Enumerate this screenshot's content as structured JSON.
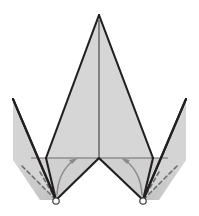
{
  "figure": {
    "canvas": {
      "width": 199,
      "height": 216,
      "background": "#ffffff"
    },
    "colors": {
      "face_light": "#d6d6d6",
      "face_mid": "#cfcfcf",
      "face_shadow_dark": "#8f8f8f",
      "face_shadow_light": "#cccccc",
      "outline": "#231f20",
      "thin_line": "#58595b",
      "dashed_line": "#6d6e71",
      "arrow": "#7a7a7a",
      "marker_fill": "#ffffff",
      "marker_stroke": "#3a3a3a"
    },
    "vertices": {
      "apex": {
        "label": "apex",
        "x": 99,
        "y": 15
      },
      "left_wing_tip": {
        "label": "left-wing-tip",
        "x": 13,
        "y": 99
      },
      "right_wing_tip": {
        "label": "right-wing-tip",
        "x": 186,
        "y": 99
      },
      "left_bottom_node": {
        "label": "left-bottom-node",
        "x": 56,
        "y": 200
      },
      "right_bottom_node": {
        "label": "right-bottom-node",
        "x": 143,
        "y": 200
      },
      "center_notch": {
        "label": "center-notch",
        "x": 99,
        "y": 158
      },
      "left_ridge_base": {
        "label": "left-ridge-base",
        "x": 38,
        "y": 158
      },
      "right_ridge_base": {
        "label": "right-ridge-base",
        "x": 161,
        "y": 158
      },
      "left_inner_fold": {
        "label": "left-inner-fold",
        "x": 46,
        "y": 158
      },
      "right_inner_fold": {
        "label": "right-inner-fold",
        "x": 153,
        "y": 158
      }
    },
    "faces": [
      {
        "name": "center-left-face",
        "fill": "face_light",
        "points": "99,15 99,158 46,158"
      },
      {
        "name": "center-right-face",
        "fill": "face_light",
        "points": "99,15 99,158 153,158"
      },
      {
        "name": "left-outer-face",
        "fill": "face_mid",
        "points": "13,99 38,158 56,200"
      },
      {
        "name": "right-outer-face",
        "fill": "face_mid",
        "points": "186,99 161,158 143,200"
      },
      {
        "name": "left-lower-panel",
        "fill": "face_light",
        "points": "38,158 99,158 99,163 56,200"
      },
      {
        "name": "right-lower-panel",
        "fill": "face_light",
        "points": "161,158 99,158 99,163 143,200"
      }
    ],
    "dashed_folds": [
      {
        "name": "left-dashed-upper",
        "from": {
          "x": 22,
          "y": 166
        },
        "to": {
          "x": 56,
          "y": 200
        }
      },
      {
        "name": "left-dashed-lower",
        "from": {
          "x": 40,
          "y": 172
        },
        "to": {
          "x": 56,
          "y": 200
        }
      },
      {
        "name": "right-dashed-upper",
        "from": {
          "x": 177,
          "y": 166
        },
        "to": {
          "x": 143,
          "y": 200
        }
      },
      {
        "name": "right-dashed-lower",
        "from": {
          "x": 159,
          "y": 172
        },
        "to": {
          "x": 143,
          "y": 200
        }
      }
    ],
    "angle_arrows": [
      {
        "name": "left-angle-arrow",
        "direction": "counterclockwise",
        "from_node": "left-bottom-node",
        "to_edge": "left-horizontal-edge"
      },
      {
        "name": "right-angle-arrow",
        "direction": "clockwise",
        "from_node": "right-bottom-node",
        "to_edge": "right-horizontal-edge"
      }
    ],
    "markers": [
      {
        "name": "left-pivot-marker",
        "x": 56,
        "y": 201,
        "r": 3.2
      },
      {
        "name": "right-pivot-marker",
        "x": 143,
        "y": 201,
        "r": 3.2
      }
    ],
    "edges": [
      {
        "name": "horizontal-baseline",
        "from": {
          "x": 38,
          "y": 158
        },
        "to": {
          "x": 161,
          "y": 158
        }
      },
      {
        "name": "center-vertical-ridge",
        "from": {
          "x": 99,
          "y": 15
        },
        "to": {
          "x": 99,
          "y": 158
        }
      }
    ]
  }
}
